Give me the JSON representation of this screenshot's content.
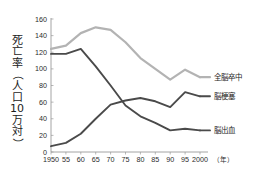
{
  "chart_data": {
    "type": "line",
    "title": "",
    "xlabel": "年",
    "ylabel": "死亡率（人口10万対）",
    "ylabel_chars": [
      "死",
      "亡",
      "率",
      "（",
      "人",
      "口",
      "10",
      "万",
      "対",
      "）"
    ],
    "x": [
      1950,
      1955,
      1960,
      1965,
      1970,
      1975,
      1980,
      1985,
      1990,
      1995,
      2000
    ],
    "categories": [
      "1950",
      "55",
      "60",
      "65",
      "70",
      "75",
      "80",
      "85",
      "90",
      "95",
      "2000"
    ],
    "xlim": [
      1950,
      2000
    ],
    "ylim": [
      0,
      160
    ],
    "yticks": [
      0,
      20,
      40,
      60,
      80,
      100,
      120,
      140,
      160
    ],
    "ytick_labels": [
      "0",
      "20",
      "40",
      "60",
      "80",
      "100",
      "120",
      "140",
      "160"
    ],
    "grid": false,
    "legend_position": "right-inline",
    "x_unit_label": "（年）",
    "series": [
      {
        "name": "全脳卒中",
        "color": "#b3b3b3",
        "values": [
          124,
          128,
          143,
          150,
          147,
          132,
          113,
          100,
          87,
          99,
          90
        ]
      },
      {
        "name": "脳梗塞",
        "color": "#4a4a4a",
        "values": [
          7,
          11,
          22,
          40,
          57,
          62,
          65,
          61,
          54,
          72,
          67
        ]
      },
      {
        "name": "脳出血",
        "color": "#4a4a4a",
        "values": [
          118,
          118,
          124,
          103,
          80,
          56,
          43,
          35,
          26,
          28,
          26
        ]
      }
    ]
  },
  "axes": {
    "y_axis_color": "#9a9a9a",
    "x_axis_color": "#9a9a9a"
  },
  "legend": {
    "items": [
      {
        "label": "全脳卒中",
        "color": "#b3b3b3"
      },
      {
        "label": "脳梗塞",
        "color": "#4a4a4a"
      },
      {
        "label": "脳出血",
        "color": "#4a4a4a"
      }
    ]
  }
}
